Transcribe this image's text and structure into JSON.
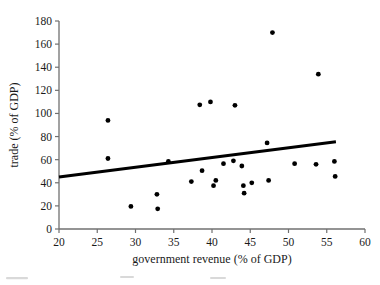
{
  "chart_data": {
    "type": "scatter",
    "title": "",
    "xlabel": "government revenue (% of GDP)",
    "ylabel": "trade (% of GDP)",
    "xlim": [
      20,
      60
    ],
    "ylim": [
      0,
      180
    ],
    "xticks": [
      20,
      25,
      30,
      35,
      40,
      45,
      50,
      55,
      60
    ],
    "yticks": [
      0,
      20,
      40,
      60,
      80,
      100,
      120,
      140,
      160,
      180
    ],
    "xtick_labels": [
      "20",
      "25",
      "30",
      "35",
      "40",
      "45",
      "50",
      "55",
      "60"
    ],
    "ytick_labels": [
      "0",
      "20",
      "40",
      "60",
      "80",
      "100",
      "120",
      "140",
      "160",
      "180"
    ],
    "grid": false,
    "legend": null,
    "marker_color": "#000000",
    "axis_color": "#707070",
    "trendline_color": "#000000",
    "points": [
      {
        "x": 26.4,
        "y": 94.0
      },
      {
        "x": 26.4,
        "y": 61.0
      },
      {
        "x": 29.4,
        "y": 19.5
      },
      {
        "x": 32.8,
        "y": 30.0
      },
      {
        "x": 32.9,
        "y": 17.5
      },
      {
        "x": 34.3,
        "y": 58.5
      },
      {
        "x": 37.3,
        "y": 41.0
      },
      {
        "x": 38.4,
        "y": 107.5
      },
      {
        "x": 38.7,
        "y": 50.5
      },
      {
        "x": 39.8,
        "y": 110.0
      },
      {
        "x": 40.2,
        "y": 37.5
      },
      {
        "x": 40.5,
        "y": 42.0
      },
      {
        "x": 41.5,
        "y": 56.5
      },
      {
        "x": 42.8,
        "y": 59.0
      },
      {
        "x": 43.0,
        "y": 107.0
      },
      {
        "x": 43.9,
        "y": 54.5
      },
      {
        "x": 44.1,
        "y": 37.5
      },
      {
        "x": 44.2,
        "y": 31.0
      },
      {
        "x": 45.2,
        "y": 40.0
      },
      {
        "x": 47.2,
        "y": 74.5
      },
      {
        "x": 47.4,
        "y": 42.0
      },
      {
        "x": 47.9,
        "y": 170.0
      },
      {
        "x": 50.8,
        "y": 56.5
      },
      {
        "x": 53.6,
        "y": 56.0
      },
      {
        "x": 53.9,
        "y": 134.0
      },
      {
        "x": 56.0,
        "y": 58.5
      },
      {
        "x": 56.1,
        "y": 45.5
      }
    ],
    "trendline": {
      "x_start": 20.0,
      "y_start": 45.0,
      "x_end": 56.2,
      "y_end": 75.5
    }
  },
  "figure": {
    "plot_area": {
      "left_px": 59,
      "right_px": 365,
      "top_px": 21,
      "bottom_px": 229
    }
  }
}
